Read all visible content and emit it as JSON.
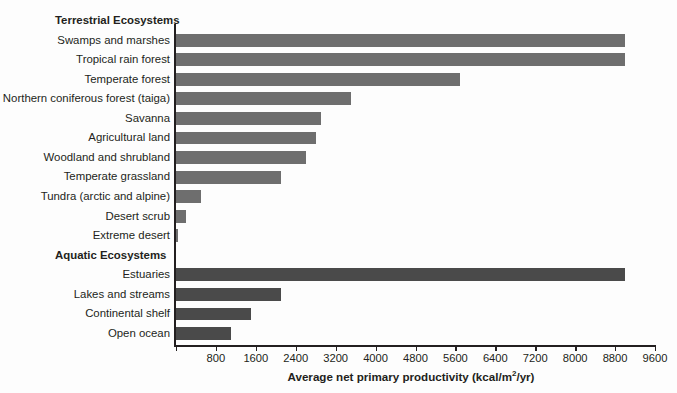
{
  "chart_data": {
    "type": "bar",
    "orientation": "horizontal",
    "title": "",
    "xlabel": "Average net primary productivity (kcal/m2/yr)",
    "ylabel": "",
    "xlim": [
      0,
      9600
    ],
    "xticks": [
      0,
      800,
      1600,
      2400,
      3200,
      4000,
      4800,
      5600,
      6400,
      7200,
      8000,
      8800,
      9600
    ],
    "xtick_labels": [
      "",
      "800",
      "1600",
      "2400",
      "3200",
      "4000",
      "4800",
      "5600",
      "6400",
      "7200",
      "8000",
      "8800",
      "9600"
    ],
    "grid": false,
    "legend": false,
    "groups": [
      {
        "name": "Terrestrial Ecosystems",
        "color": "#6e6e6e",
        "categories": [
          "Swamps and marshes",
          "Tropical rain forest",
          "Temperate forest",
          "Northern coniferous forest (taiga)",
          "Savanna",
          "Agricultural land",
          "Woodland and shrubland",
          "Temperate grassland",
          "Tundra (arctic and alpine)",
          "Desert scrub",
          "Extreme desert"
        ],
        "values": [
          9000,
          9000,
          5700,
          3500,
          2900,
          2800,
          2600,
          2100,
          500,
          200,
          40
        ]
      },
      {
        "name": "Aquatic Ecosystems",
        "color": "#4a4a4a",
        "categories": [
          "Estuaries",
          "Lakes and streams",
          "Continental shelf",
          "Open ocean"
        ],
        "values": [
          9000,
          2100,
          1500,
          1100
        ]
      }
    ],
    "categories": [
      "Swamps and marshes",
      "Tropical rain forest",
      "Temperate forest",
      "Northern coniferous forest (taiga)",
      "Savanna",
      "Agricultural land",
      "Woodland and shrubland",
      "Temperate grassland",
      "Tundra (arctic and alpine)",
      "Desert scrub",
      "Extreme desert",
      "Estuaries",
      "Lakes and streams",
      "Continental shelf",
      "Open ocean"
    ],
    "values": [
      9000,
      9000,
      5700,
      3500,
      2900,
      2800,
      2600,
      2100,
      500,
      200,
      40,
      9000,
      2100,
      1500,
      1100
    ]
  },
  "axis": {
    "title_main": "Average net primary productivity (kcal/m",
    "title_sup": "2",
    "title_tail": "/yr)"
  },
  "sections": {
    "terrestrial_header": "Terrestrial Ecosystems",
    "aquatic_header": "Aquatic Ecosystems"
  },
  "colors": {
    "terrestrial_bar": "#6e6e6e",
    "aquatic_bar": "#4a4a4a",
    "axis": "#231f20",
    "background": "#fdfdfd"
  }
}
